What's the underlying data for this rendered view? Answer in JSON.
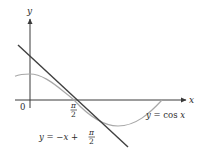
{
  "figure": {
    "y_axis_label": "y",
    "x_axis_label": "x",
    "origin_label": "0",
    "tick_label_numerator": "π",
    "tick_label_denominator": "2",
    "curve_label": "y = cos x",
    "tangent_label_main": "y = −x +",
    "tangent_label_numerator": "π",
    "tangent_label_denominator": "2"
  },
  "colors": {
    "axis": "#3a3a3a",
    "curve": "#a8a8a8",
    "tangent_line": "#3f3f3f",
    "text": "#2b2b2b"
  }
}
